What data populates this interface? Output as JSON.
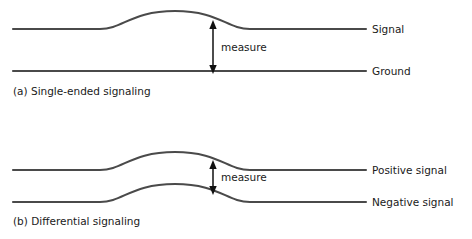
{
  "figure": {
    "stroke_color": "#4a4a4a",
    "arrow_color": "#111111",
    "background": "#ffffff"
  },
  "panels": [
    {
      "id": "single-ended",
      "caption": "(a) Single-ended signaling",
      "measure_label": "measure",
      "traces": [
        {
          "id": "signal",
          "label": "Signal",
          "baseline_y": 29,
          "peak_y": 11
        },
        {
          "id": "ground",
          "label": "Ground",
          "baseline_y": 71,
          "peak_y": 71
        }
      ]
    },
    {
      "id": "differential",
      "caption": "(b) Differential signaling",
      "measure_label": "measure",
      "traces": [
        {
          "id": "positive",
          "label": "Positive signal",
          "baseline_y": 170,
          "peak_y": 152
        },
        {
          "id": "negative",
          "label": "Negative signal",
          "baseline_y": 202,
          "peak_y": 184
        }
      ]
    }
  ]
}
